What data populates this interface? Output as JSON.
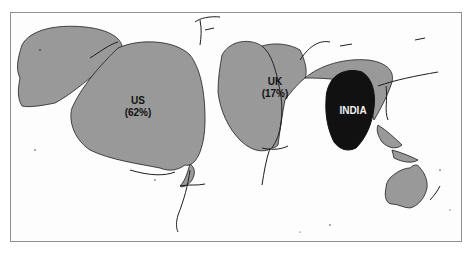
{
  "map": {
    "type": "cartogram",
    "colors": {
      "land": "#999999",
      "highlight": "#111111",
      "coast": "#1e1e1e",
      "background": "#fdfdfd",
      "border": "#8f8f8f"
    },
    "labels": [
      {
        "id": "us",
        "name": "US",
        "share": "(62%)"
      },
      {
        "id": "uk",
        "name": "UK",
        "share": "(17%)"
      },
      {
        "id": "india",
        "name": "INDIA",
        "share": ""
      }
    ]
  }
}
